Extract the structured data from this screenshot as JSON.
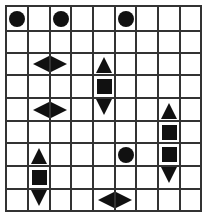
{
  "puzzle": {
    "type": "battleship-grid",
    "cols": 9,
    "rows": 9,
    "colors": {
      "grid_line": "#333333",
      "piece": "#111111",
      "background": "#ffffff"
    },
    "pieces": [
      {
        "row": 0,
        "col": 0,
        "shape": "circle"
      },
      {
        "row": 0,
        "col": 2,
        "shape": "circle"
      },
      {
        "row": 0,
        "col": 5,
        "shape": "circle"
      },
      {
        "row": 2,
        "col": 1,
        "shape": "tri-left"
      },
      {
        "row": 2,
        "col": 2,
        "shape": "tri-right"
      },
      {
        "row": 2,
        "col": 4,
        "shape": "tri-up"
      },
      {
        "row": 3,
        "col": 4,
        "shape": "square"
      },
      {
        "row": 4,
        "col": 1,
        "shape": "tri-left"
      },
      {
        "row": 4,
        "col": 2,
        "shape": "tri-right"
      },
      {
        "row": 4,
        "col": 4,
        "shape": "tri-down"
      },
      {
        "row": 4,
        "col": 7,
        "shape": "tri-up"
      },
      {
        "row": 5,
        "col": 7,
        "shape": "square"
      },
      {
        "row": 6,
        "col": 1,
        "shape": "tri-up"
      },
      {
        "row": 6,
        "col": 5,
        "shape": "circle"
      },
      {
        "row": 6,
        "col": 7,
        "shape": "square"
      },
      {
        "row": 7,
        "col": 1,
        "shape": "square"
      },
      {
        "row": 7,
        "col": 7,
        "shape": "tri-down"
      },
      {
        "row": 8,
        "col": 1,
        "shape": "tri-down"
      },
      {
        "row": 8,
        "col": 4,
        "shape": "tri-left"
      },
      {
        "row": 8,
        "col": 5,
        "shape": "tri-right"
      }
    ]
  }
}
